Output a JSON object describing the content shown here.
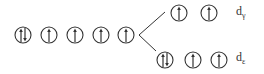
{
  "diagram": {
    "degenerate_orbitals": [
      {
        "x": 23,
        "y": 35,
        "electrons": "up-down"
      },
      {
        "x": 49,
        "y": 35,
        "electrons": "up"
      },
      {
        "x": 75,
        "y": 35,
        "electrons": "up"
      },
      {
        "x": 101,
        "y": 35,
        "electrons": "up"
      },
      {
        "x": 126,
        "y": 35,
        "electrons": "up"
      }
    ],
    "upper_set": {
      "label_main": "d",
      "label_sub": "γ",
      "orbitals": [
        {
          "x": 179,
          "y": 13,
          "electrons": "up"
        },
        {
          "x": 209,
          "y": 13,
          "electrons": "up"
        }
      ]
    },
    "lower_set": {
      "label_main": "d",
      "label_sub": "ε",
      "orbitals": [
        {
          "x": 165,
          "y": 60,
          "electrons": "up-down"
        },
        {
          "x": 193,
          "y": 60,
          "electrons": "up"
        },
        {
          "x": 219,
          "y": 60,
          "electrons": "up"
        }
      ]
    },
    "colors": {
      "stroke": "#333333"
    }
  }
}
